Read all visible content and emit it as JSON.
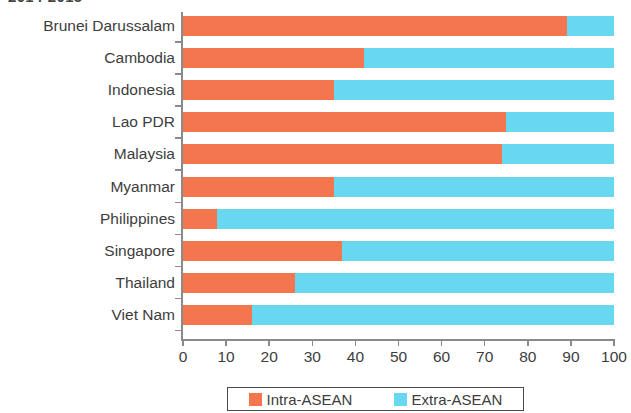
{
  "chart_data": {
    "type": "bar",
    "orientation": "horizontal",
    "stacked": true,
    "normalized": true,
    "title": "2014-2015",
    "xlabel": "",
    "ylabel": "",
    "xlim": [
      0,
      100
    ],
    "xticks": [
      0,
      10,
      20,
      30,
      40,
      50,
      60,
      70,
      80,
      90,
      100
    ],
    "xtick_labels": [
      "0",
      "10",
      "20",
      "30",
      "40",
      "50",
      "60",
      "70",
      "80",
      "90",
      "100"
    ],
    "grid": false,
    "legend_position": "bottom",
    "categories": [
      "Brunei Darussalam",
      "Cambodia",
      "Indonesia",
      "Lao PDR",
      "Malaysia",
      "Myanmar",
      "Philippines",
      "Singapore",
      "Thailand",
      "Viet Nam"
    ],
    "series": [
      {
        "name": "Intra-ASEAN",
        "color": "#F4764F",
        "values": [
          89,
          42,
          35,
          75,
          74,
          35,
          8,
          37,
          26,
          16
        ]
      },
      {
        "name": "Extra-ASEAN",
        "color": "#68D7F0",
        "values": [
          11,
          58,
          65,
          25,
          26,
          65,
          92,
          63,
          74,
          84
        ]
      }
    ]
  },
  "legend": {
    "entries": [
      {
        "label": "Intra-ASEAN",
        "color": "#F4764F"
      },
      {
        "label": "Extra-ASEAN",
        "color": "#68D7F0"
      }
    ]
  },
  "colors": {
    "intra_asean": "#F4764F",
    "extra_asean": "#68D7F0",
    "axis": "#8a8a8a",
    "text": "#3d3d3d",
    "background": "#ffffff"
  }
}
